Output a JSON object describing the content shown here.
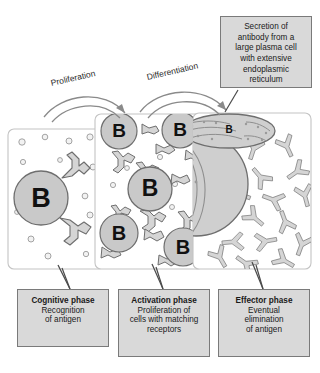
{
  "figure": {
    "type": "biology-process-diagram",
    "background_color": "#ffffff",
    "ink_color": "#4a4a4a",
    "box_fill": "#d9d9d9",
    "box_border": "#7a7a7a",
    "panel_fill": "#ffffff",
    "panel_border": "#bdbdbd",
    "cell_fill": "#c9c9c9",
    "cell_border": "#6e6e6e"
  },
  "process_labels": [
    {
      "id": "proliferation",
      "text": "Proliferation"
    },
    {
      "id": "differentiation",
      "text": "Differentiation"
    }
  ],
  "callout": {
    "id": "secretion-callout",
    "lines": [
      "Secretion of",
      "antibody from a",
      "large plasma cell",
      "with extensive",
      "endoplasmic",
      "reticulum"
    ]
  },
  "phases": [
    {
      "id": "cognitive",
      "title": "Cognitive phase",
      "description_lines": [
        "Recognition",
        "of antigen"
      ]
    },
    {
      "id": "activation",
      "title": "Activation phase",
      "description_lines": [
        "Proliferation of",
        "cells with matching",
        "receptors"
      ]
    },
    {
      "id": "effector",
      "title": "Effector phase",
      "description_lines": [
        "Eventual",
        "elimination",
        "of antigen"
      ]
    }
  ],
  "panels": [
    {
      "id": "panel-cognitive",
      "cell_labels": [
        "B"
      ],
      "cell_count": 1,
      "antigen_dot_count": 11,
      "receptor_count": 2
    },
    {
      "id": "panel-activation",
      "cell_labels": [
        "B",
        "B",
        "B",
        "B",
        "B"
      ],
      "cell_count": 5,
      "antigen_dot_count": 5,
      "receptor_count": 10
    },
    {
      "id": "panel-effector",
      "cell_labels": [
        "B"
      ],
      "plasma_cell_label": "B",
      "antibody_count": 17
    }
  ],
  "cell_glyph": "B"
}
